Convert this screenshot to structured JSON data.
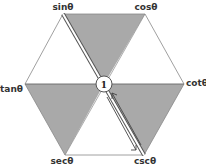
{
  "diagram": {
    "center_label": "1",
    "vertices": [
      {
        "id": "sin",
        "label": "sinθ"
      },
      {
        "id": "cos",
        "label": "cosθ"
      },
      {
        "id": "cot",
        "label": "cotθ"
      },
      {
        "id": "csc",
        "label": "cscθ"
      },
      {
        "id": "sec",
        "label": "secθ"
      },
      {
        "id": "tan",
        "label": "tanθ"
      }
    ],
    "shaded_triangles": [
      "sin-cos-1",
      "tan-1-sec",
      "1-cot-csc"
    ],
    "arrow": {
      "from": "sin",
      "to": "csc",
      "note": "reciprocal pair through center"
    },
    "colors": {
      "shade": "#a8a8a8",
      "line": "#555555",
      "background": "#ffffff"
    }
  }
}
